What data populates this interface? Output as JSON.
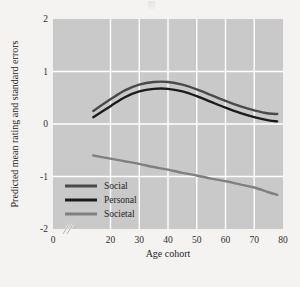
{
  "figure": {
    "panel_color": "#c9c9c9",
    "grid_color": "#ffffff",
    "page_color": "#f4f3f1",
    "axis_break_note": "//"
  },
  "chart_data": {
    "type": "line",
    "title": "",
    "xlabel": "Age cohort",
    "ylabel": "Predicted mean rating and standard errors",
    "xlim": [
      0,
      80
    ],
    "ylim": [
      -2,
      2
    ],
    "xticks": [
      0,
      20,
      30,
      40,
      50,
      60,
      70,
      80
    ],
    "xticklabels": [
      "0",
      "20",
      "30",
      "40",
      "50",
      "60",
      "70",
      "80"
    ],
    "yticks": [
      -2,
      -1,
      0,
      1,
      2
    ],
    "yticklabels": [
      "-2",
      "-1",
      "0",
      "1",
      "2"
    ],
    "grid": true,
    "grid_axis": "both",
    "axis_break_x": [
      4,
      14
    ],
    "legend_position": "lower left",
    "x": [
      14,
      20,
      25,
      30,
      35,
      40,
      45,
      50,
      55,
      60,
      65,
      70,
      75,
      78
    ],
    "series": [
      {
        "name": "Social",
        "color": "#4a4a4a",
        "values": [
          0.25,
          0.47,
          0.64,
          0.75,
          0.8,
          0.8,
          0.75,
          0.66,
          0.55,
          0.44,
          0.34,
          0.26,
          0.2,
          0.19
        ]
      },
      {
        "name": "Personal",
        "color": "#1c1c1c",
        "values": [
          0.13,
          0.34,
          0.51,
          0.62,
          0.67,
          0.67,
          0.62,
          0.53,
          0.42,
          0.31,
          0.21,
          0.13,
          0.07,
          0.05
        ]
      },
      {
        "name": "Societal",
        "color": "#808080",
        "values": [
          -0.6,
          -0.66,
          -0.71,
          -0.76,
          -0.82,
          -0.87,
          -0.93,
          -0.98,
          -1.04,
          -1.09,
          -1.15,
          -1.21,
          -1.3,
          -1.35
        ]
      }
    ]
  },
  "legend": {
    "items": [
      {
        "label": "Social",
        "color": "#4a4a4a"
      },
      {
        "label": "Personal",
        "color": "#1c1c1c"
      },
      {
        "label": "Societal",
        "color": "#808080"
      }
    ]
  }
}
